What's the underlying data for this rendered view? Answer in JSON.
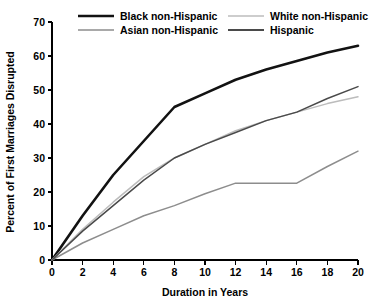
{
  "chart_data": {
    "type": "line",
    "title": "",
    "xlabel": "Duration in Years",
    "ylabel": "Percent of First Marriages Disrupted",
    "xlim": [
      0,
      20
    ],
    "ylim": [
      0,
      70
    ],
    "xticks": [
      0,
      2,
      4,
      6,
      8,
      10,
      12,
      14,
      16,
      18,
      20
    ],
    "yticks": [
      0,
      10,
      20,
      30,
      40,
      50,
      60,
      70
    ],
    "grid": false,
    "legend_position": "top",
    "x": [
      0,
      2,
      4,
      6,
      8,
      10,
      12,
      14,
      16,
      18,
      20
    ],
    "series": [
      {
        "name": "Black non-Hispanic",
        "color": "#121212",
        "width": 2.6,
        "values": [
          0,
          13,
          25,
          35,
          45,
          49,
          53,
          56,
          58.5,
          61,
          63
        ]
      },
      {
        "name": "White non-Hispanic",
        "color": "#bcbcbc",
        "width": 1.5,
        "values": [
          0,
          9,
          17,
          24.5,
          30,
          34,
          38,
          41,
          43.5,
          46,
          48
        ]
      },
      {
        "name": "Asian non-Hispanic",
        "color": "#8d8d8d",
        "width": 1.5,
        "values": [
          0,
          5,
          9,
          13,
          16,
          19.5,
          22.6,
          22.6,
          22.6,
          27.5,
          32
        ]
      },
      {
        "name": "Hispanic",
        "color": "#4a4a4a",
        "width": 1.5,
        "values": [
          0,
          8.5,
          16,
          23.5,
          30,
          34,
          37.5,
          41,
          43.5,
          47.5,
          51
        ]
      }
    ],
    "legend": [
      {
        "label": "Black non-Hispanic",
        "color": "#121212",
        "width": 2.6
      },
      {
        "label": "White non-Hispanic",
        "color": "#bcbcbc",
        "width": 1.5
      },
      {
        "label": "Asian non-Hispanic",
        "color": "#8d8d8d",
        "width": 1.5
      },
      {
        "label": "Hispanic",
        "color": "#4a4a4a",
        "width": 1.8
      }
    ]
  }
}
